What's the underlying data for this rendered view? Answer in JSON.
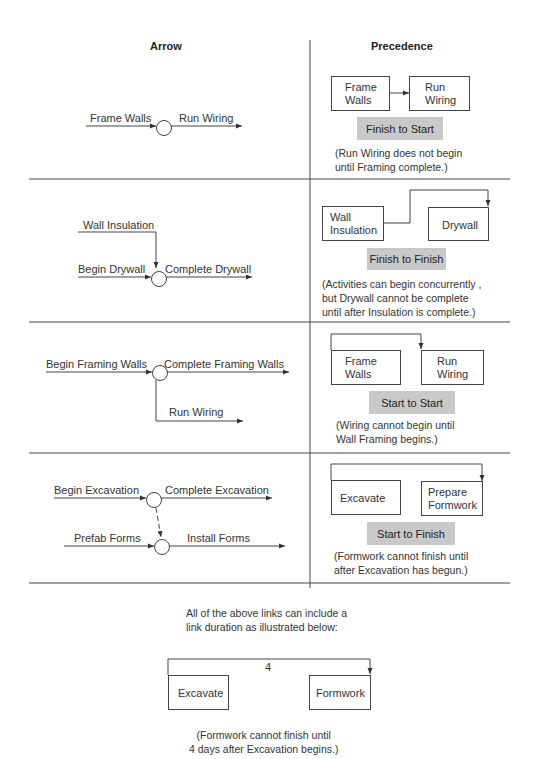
{
  "headers": {
    "arrow": "Arrow",
    "precedence": "Precedence"
  },
  "rows": [
    {
      "type": "Finish to Start",
      "arrow": {
        "in_label": "Frame Walls",
        "out_label": "Run Wiring"
      },
      "precedence": {
        "box_a": [
          "Frame",
          "Walls"
        ],
        "box_b": [
          "Run",
          "Wiring"
        ],
        "note": [
          "(Run Wiring does not begin",
          "until Framing complete.)"
        ]
      }
    },
    {
      "type": "Finish to Finish",
      "arrow": {
        "top_label": "Wall Insulation",
        "in_label": "Begin Drywall",
        "out_label": "Complete Drywall"
      },
      "precedence": {
        "box_a": [
          "Wall",
          "Insulation"
        ],
        "box_b": [
          "Drywall"
        ],
        "note": [
          "(Activities can begin concurrently ,",
          "but Drywall cannot be complete",
          "until after Insulation is complete.)"
        ]
      }
    },
    {
      "type": "Start to Start",
      "arrow": {
        "in_label": "Begin Framing Walls",
        "out_label": "Complete Framing Walls",
        "branch_label": "Run Wiring"
      },
      "precedence": {
        "box_a": [
          "Frame",
          "Walls"
        ],
        "box_b": [
          "Run",
          "Wiring"
        ],
        "note": [
          "(Wiring cannot begin until",
          "Wall Framing begins.)"
        ]
      }
    },
    {
      "type": "Start to Finish",
      "arrow": {
        "in_label": "Begin Excavation",
        "out_label": "Complete Excavation",
        "in2_label": "Prefab Forms",
        "out2_label": "Install Forms"
      },
      "precedence": {
        "box_a": [
          "Excavate"
        ],
        "box_b": [
          "Prepare",
          "Formwork"
        ],
        "note": [
          "(Formwork cannot finish until",
          "after Excavation has begun.)"
        ]
      }
    }
  ],
  "footer": {
    "intro": [
      "All of the above links can include a",
      "link duration as illustrated below:"
    ],
    "duration": "4",
    "box_a": "Excavate",
    "box_b": "Formwork",
    "note": [
      "(Formwork cannot finish until",
      "4 days after Excavation begins.)"
    ]
  },
  "colors": {
    "line": "#444444",
    "label_fill": "#c9c9c9",
    "text": "#2a2a2a"
  }
}
